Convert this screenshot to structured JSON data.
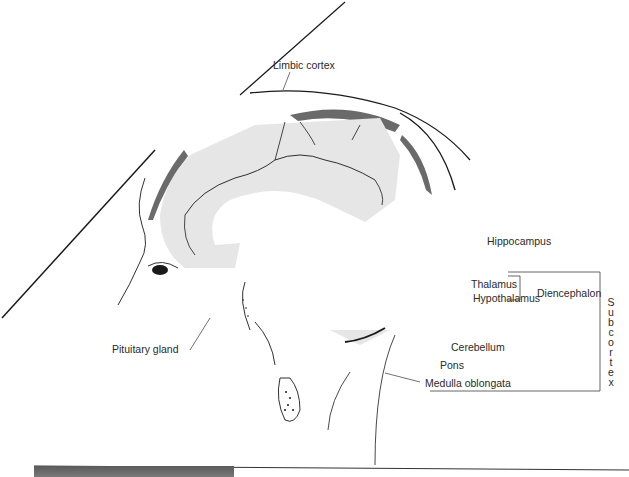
{
  "diagram": {
    "labels": {
      "limbic_cortex": "Limbic cortex",
      "hippocampus": "Hippocampus",
      "thalamus": "Thalamus",
      "hypothalamus": "Hypothalamus",
      "diencephalon": "Diencephalon",
      "pituitary_gland": "Pituitary gland",
      "cerebellum": "Cerebellum",
      "pons": "Pons",
      "medulla_oblongata": "Medulla oblongata",
      "subcortex": [
        "S",
        "u",
        "b",
        "c",
        "o",
        "r",
        "t",
        "e",
        "x"
      ]
    },
    "colors": {
      "limbic_fill": "#e6e6e6",
      "cortex_band": "#6a6a6a",
      "line": "#1a1a1a",
      "bracket": "#555555"
    }
  }
}
